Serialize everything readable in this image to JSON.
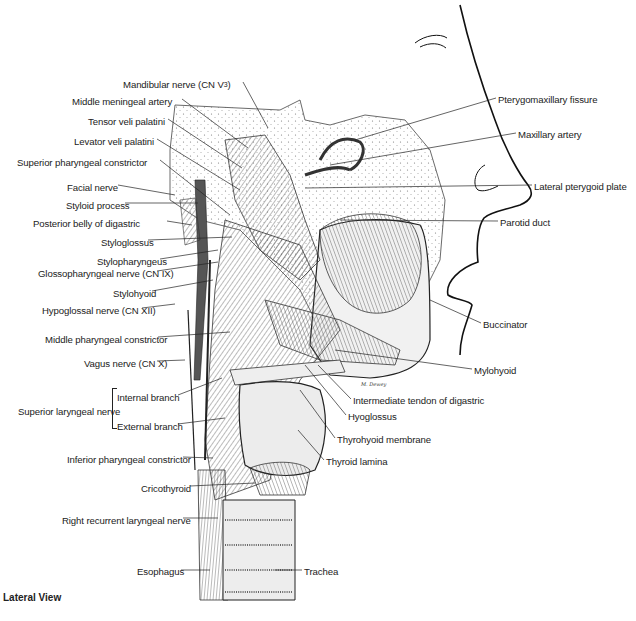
{
  "figure": {
    "caption": "Lateral View",
    "signature": "M. Dewey",
    "labels_left": [
      {
        "id": "mandibular",
        "text": "Mandibular nerve (CN V",
        "sup": "3",
        "suffix": ")",
        "x": 123,
        "y": 79
      },
      {
        "id": "middle-meningeal",
        "text": "Middle meningeal artery",
        "x": 72,
        "y": 96
      },
      {
        "id": "tensor",
        "text": "Tensor veli palatini",
        "x": 88,
        "y": 116
      },
      {
        "id": "levator",
        "text": "Levator veli palatini",
        "x": 74,
        "y": 136
      },
      {
        "id": "sup-constrictor",
        "text": "Superior pharyngeal constrictor",
        "x": 17,
        "y": 157
      },
      {
        "id": "facial",
        "text": "Facial nerve",
        "x": 67,
        "y": 182
      },
      {
        "id": "styloid",
        "text": "Styloid process",
        "x": 66,
        "y": 200
      },
      {
        "id": "post-digastric",
        "text": "Posterior belly of digastric",
        "x": 33,
        "y": 218
      },
      {
        "id": "styloglossus",
        "text": "Styloglossus",
        "x": 101,
        "y": 237
      },
      {
        "id": "stylopharyngeus",
        "text": "Stylopharyngeus",
        "x": 97,
        "y": 256
      },
      {
        "id": "glossopharyngeal",
        "text": "Glossopharyngeal nerve (CN IX)",
        "x": 38,
        "y": 268
      },
      {
        "id": "stylohyoid",
        "text": "Stylohyoid",
        "x": 113,
        "y": 288
      },
      {
        "id": "hypoglossal",
        "text": "Hypoglossal nerve (CN XII)",
        "x": 42,
        "y": 305
      },
      {
        "id": "mid-constrictor",
        "text": "Middle pharyngeal constrictor",
        "x": 45,
        "y": 334
      },
      {
        "id": "vagus",
        "text": "Vagus nerve (CN X)",
        "x": 84,
        "y": 358
      },
      {
        "id": "internal-branch",
        "text": "Internal branch",
        "x": 117,
        "y": 392
      },
      {
        "id": "sup-laryngeal",
        "text": "Superior laryngeal nerve",
        "x": 18,
        "y": 406
      },
      {
        "id": "external-branch",
        "text": "External branch",
        "x": 117,
        "y": 421
      },
      {
        "id": "inf-constrictor",
        "text": "Inferior pharyngeal constrictor",
        "x": 67,
        "y": 454
      },
      {
        "id": "cricothyroid",
        "text": "Cricothyroid",
        "x": 141,
        "y": 483
      },
      {
        "id": "recurrent-laryngeal",
        "text": "Right recurrent laryngeal nerve",
        "x": 62,
        "y": 515
      },
      {
        "id": "esophagus",
        "text": "Esophagus",
        "x": 137,
        "y": 566
      }
    ],
    "labels_right": [
      {
        "id": "pterygomaxillary",
        "text": "Pterygomaxillary fissure",
        "x": 498,
        "y": 94
      },
      {
        "id": "maxillary-artery",
        "text": "Maxillary artery",
        "x": 518,
        "y": 129
      },
      {
        "id": "lateral-pterygoid",
        "text": "Lateral pterygoid plate",
        "x": 534,
        "y": 181
      },
      {
        "id": "parotid-duct",
        "text": "Parotid duct",
        "x": 500,
        "y": 217
      },
      {
        "id": "buccinator",
        "text": "Buccinator",
        "x": 483,
        "y": 319
      },
      {
        "id": "mylohyoid",
        "text": "Mylohyoid",
        "x": 474,
        "y": 365
      },
      {
        "id": "int-tendon-digastric",
        "text": "Intermediate tendon of digastric",
        "x": 353,
        "y": 395
      },
      {
        "id": "hyoglossus",
        "text": "Hyoglossus",
        "x": 348,
        "y": 411
      },
      {
        "id": "thyrohyoid-membrane",
        "text": "Thyrohyoid membrane",
        "x": 337,
        "y": 434
      },
      {
        "id": "thyroid-lamina",
        "text": "Thyroid lamina",
        "x": 326,
        "y": 456
      },
      {
        "id": "trachea",
        "text": "Trachea",
        "x": 304,
        "y": 566
      }
    ]
  }
}
